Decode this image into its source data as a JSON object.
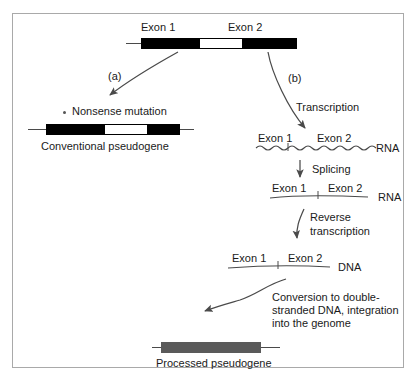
{
  "figure": {
    "border_color": "#a9a9a9",
    "background": "#ffffff",
    "ink_color": "#1a1a1a"
  },
  "source_gene": {
    "exon1_label": "Exon 1",
    "exon2_label": "Exon 2",
    "exon_color": "#000000",
    "intron_color": "#ffffff"
  },
  "branches": {
    "a_label": "(a)",
    "b_label": "(b)"
  },
  "pathway_a": {
    "mutation_label": "Nonsense mutation",
    "mutation_marker": "asterisk-marker",
    "exon1_label": "Exon 1",
    "exon2_label": "Exon 2",
    "product_label": "Conventional pseudogene"
  },
  "pathway_b": {
    "transcription_label": "Transcription",
    "pre_mrna": {
      "exon1_label": "Exon 1",
      "exon2_label": "Exon 2",
      "molecule_label": "RNA",
      "strand_style": "wavy"
    },
    "splicing_label": "Splicing",
    "mature_mrna": {
      "exon1_label": "Exon 1",
      "exon2_label": "Exon 2",
      "molecule_label": "RNA",
      "strand_style": "straight"
    },
    "reverse_transcription_label_line1": "Reverse",
    "reverse_transcription_label_line2": "transcription",
    "cdna": {
      "exon1_label": "Exon 1",
      "exon2_label": "Exon 2",
      "molecule_label": "DNA",
      "strand_style": "straight"
    },
    "conversion_label_line1": "Conversion to double-",
    "conversion_label_line2": "stranded DNA, integration",
    "conversion_label_line3": "into the genome",
    "product_label": "Processed pseudogene",
    "product_bar_color": "#5a5a5a"
  }
}
